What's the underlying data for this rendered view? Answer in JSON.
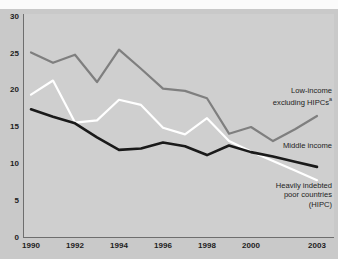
{
  "chart_data": {
    "type": "line",
    "title": "",
    "subtitle": "",
    "xlabel": "",
    "ylabel": "",
    "xlim": [
      1989.6,
      2003.6
    ],
    "ylim": [
      0,
      30
    ],
    "grid": false,
    "legend_position": "inline-right-annotations",
    "x": [
      1990,
      1991,
      1992,
      1993,
      1994,
      1995,
      1996,
      1997,
      1998,
      1999,
      2000,
      2001,
      2002,
      2003
    ],
    "xticks": [
      "1990",
      "1992",
      "1994",
      "1996",
      "1998",
      "2000",
      "2003"
    ],
    "xtick_values": [
      1990,
      1992,
      1994,
      1996,
      1998,
      2000,
      2003
    ],
    "yticks": [
      "0",
      "5",
      "10",
      "15",
      "20",
      "25",
      "30"
    ],
    "ytick_values": [
      0,
      5,
      10,
      15,
      20,
      25,
      30
    ],
    "series": [
      {
        "name": "Low-income excluding HIPCs",
        "color": "#7f7f7f",
        "values": [
          25.0,
          23.6,
          24.7,
          21.0,
          25.4,
          22.8,
          20.1,
          19.8,
          18.8,
          14.0,
          14.9,
          13.0,
          14.6,
          16.4
        ]
      },
      {
        "name": "Heavily indebted poor countries (HIPC)",
        "color": "#ffffff",
        "values": [
          19.3,
          21.2,
          15.5,
          15.8,
          18.6,
          17.9,
          14.8,
          13.9,
          16.1,
          13.0,
          11.6,
          10.3,
          9.0,
          7.7
        ]
      },
      {
        "name": "Middle income",
        "color": "#1a1a1a",
        "values": [
          17.3,
          16.3,
          15.4,
          13.5,
          11.8,
          12.0,
          12.8,
          12.3,
          11.1,
          12.4,
          11.5,
          10.9,
          10.2,
          9.5
        ]
      }
    ]
  },
  "annotations": {
    "low_income": {
      "line1": "Low-income",
      "line2": "excluding HIPCs",
      "footnote_marker": "a"
    },
    "middle_income": {
      "line1": "Middle income"
    },
    "hipc": {
      "line1": "Heavily indebted",
      "line2": "poor countries",
      "line3": "(HIPC)"
    }
  },
  "colors": {
    "background": "#c9c9c9",
    "plot_background": "#cfcfcf",
    "axis": "#6e6e6e",
    "low_income_line": "#7f7f7f",
    "hipc_line": "#ffffff",
    "middle_income_line": "#1a1a1a",
    "text": "#1d1d1d"
  }
}
